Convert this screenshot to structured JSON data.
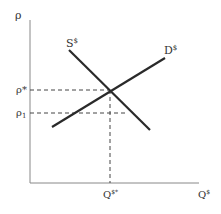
{
  "diagram": {
    "axis_y_label": "ρ",
    "axis_x_label": "Q",
    "axis_x_label_sup": "$",
    "supply_label": "S",
    "supply_label_sup": "$",
    "demand_label": "D",
    "demand_label_sup": "$",
    "price_eq_label": "ρ*",
    "price_1_label": "ρ",
    "price_1_sub": "1",
    "quantity_eq_label": "Q",
    "quantity_eq_sup": "$*"
  },
  "colors": {
    "axis": "#888888",
    "curve": "#2a2a2a",
    "dashed": "#444444",
    "text": "#333333"
  }
}
